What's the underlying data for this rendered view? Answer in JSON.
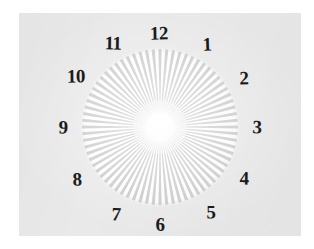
{
  "image": {
    "title": "Radial spoke resolution target with clock numerals",
    "width": 314,
    "height": 249,
    "background_color": "#ffffff",
    "paper_color": "#e9e9e9",
    "ink_color": "#1b1b1b"
  },
  "target": {
    "kind": "siemens-star",
    "center_x": 160,
    "center_y": 127,
    "radius": 78,
    "spoke_count": 72,
    "spoke_color": "#c9c9c9",
    "inner_blur_radius": 14,
    "disc_fill": "#ffffff"
  },
  "clock_face": {
    "numeral_count": 12,
    "numerals": [
      {
        "label": "12",
        "hour": 12,
        "x": 159,
        "y": 33,
        "class": "n12"
      },
      {
        "label": "1",
        "hour": 1,
        "x": 207,
        "y": 44,
        "class": "n1"
      },
      {
        "label": "2",
        "hour": 2,
        "x": 244,
        "y": 78,
        "class": "n2"
      },
      {
        "label": "3",
        "hour": 3,
        "x": 257,
        "y": 127,
        "class": "n3"
      },
      {
        "label": "4",
        "hour": 4,
        "x": 244,
        "y": 178,
        "class": "n4"
      },
      {
        "label": "5",
        "hour": 5,
        "x": 211,
        "y": 212,
        "class": "n5"
      },
      {
        "label": "6",
        "hour": 6,
        "x": 160,
        "y": 224,
        "class": "n6"
      },
      {
        "label": "7",
        "hour": 7,
        "x": 116,
        "y": 214,
        "class": "n7"
      },
      {
        "label": "8",
        "hour": 8,
        "x": 77,
        "y": 179,
        "class": "n8"
      },
      {
        "label": "9",
        "hour": 9,
        "x": 63,
        "y": 127,
        "class": "n9"
      },
      {
        "label": "10",
        "hour": 10,
        "x": 76,
        "y": 76,
        "class": "n10"
      },
      {
        "label": "11",
        "hour": 11,
        "x": 113,
        "y": 43,
        "class": "n11"
      }
    ]
  },
  "paper": {
    "left": 19,
    "top": 13,
    "width": 282,
    "height": 223
  }
}
